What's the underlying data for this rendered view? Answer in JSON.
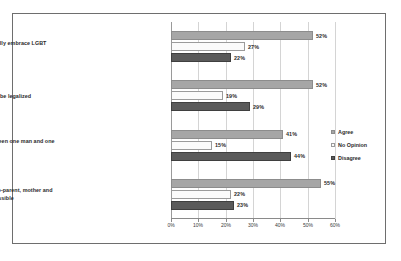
{
  "chart_data": {
    "type": "bar",
    "orientation": "horizontal",
    "title": "",
    "xlabel": "",
    "ylabel": "",
    "xlim": [
      0,
      60
    ],
    "xticks": [
      "0%",
      "10%",
      "20%",
      "30%",
      "40%",
      "50%",
      "60%"
    ],
    "grid": true,
    "legend_position": "right",
    "categories": [
      "Religious communities should fully embrace LGBT persons",
      "Same sex marriage should be legalized",
      "Marriage is only a relationship between one man and one woman",
      "Children ought to be raised in a two-parent, mother and father families, if possible"
    ],
    "series": [
      {
        "name": "Agree",
        "color": "#a6a6a6",
        "values": [
          52,
          52,
          41,
          55
        ],
        "labels": [
          "52%",
          "52%",
          "41%",
          "55%"
        ]
      },
      {
        "name": "No Opinion",
        "color": "#fbfbfb",
        "values": [
          27,
          19,
          15,
          22
        ],
        "labels": [
          "27%",
          "19%",
          "15%",
          "22%"
        ]
      },
      {
        "name": "Disagree",
        "color": "#5a5a5a",
        "values": [
          22,
          29,
          44,
          23
        ],
        "labels": [
          "22%",
          "29%",
          "44%",
          "23%"
        ]
      }
    ]
  },
  "legend": {
    "items": [
      {
        "label": "Agree"
      },
      {
        "label": "No Opinion"
      },
      {
        "label": "Disagree"
      }
    ]
  }
}
